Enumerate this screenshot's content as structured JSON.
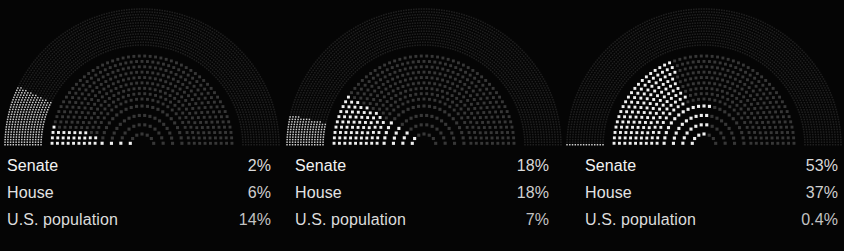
{
  "background": "#050505",
  "colors": {
    "dot_dim": "#3a3a3a",
    "dot_dim_outer": "#262626",
    "dot_highlight": "#efefef",
    "dot_highlight_outer": "#cfcfcf",
    "label_text": "#ededed",
    "value_text": "#d0d0d0"
  },
  "chart_data": {
    "type": "pie",
    "title": "",
    "subtitle": "",
    "xlabel": "",
    "ylabel": "",
    "legend_position": "below",
    "grid": false,
    "chart_style": "concentric-semicircle-dot-arcs",
    "ring_order_outer_to_inner": [
      "U.S. population",
      "House",
      "Senate"
    ],
    "rings": [
      {
        "name": "U.S. population",
        "dot_count": 1000,
        "rows": 14,
        "dot_size_px": 1.5
      },
      {
        "name": "House",
        "dot_count": 435,
        "rows": 9,
        "dot_size_px": 3.0
      },
      {
        "name": "Senate",
        "dot_count": 100,
        "rows": 4,
        "dot_size_px": 3.2
      }
    ],
    "panels": [
      {
        "id": "panel-1",
        "series": [
          {
            "name": "Senate",
            "value": 2,
            "label": "2%"
          },
          {
            "name": "House",
            "value": 6,
            "label": "6%"
          },
          {
            "name": "U.S. population",
            "value": 14,
            "label": "14%"
          }
        ]
      },
      {
        "id": "panel-2",
        "series": [
          {
            "name": "Senate",
            "value": 18,
            "label": "18%"
          },
          {
            "name": "House",
            "value": 18,
            "label": "18%"
          },
          {
            "name": "U.S. population",
            "value": 7,
            "label": "7%"
          }
        ]
      },
      {
        "id": "panel-3",
        "series": [
          {
            "name": "Senate",
            "value": 53,
            "label": "53%"
          },
          {
            "name": "House",
            "value": 37,
            "label": "37%"
          },
          {
            "name": "U.S. population",
            "value": 0.4,
            "label": "0.4%"
          }
        ]
      }
    ]
  },
  "panels": [
    {
      "rows": [
        {
          "label": "Senate",
          "value": "2%"
        },
        {
          "label": "House",
          "value": "6%"
        },
        {
          "label": "U.S. population",
          "value": "14%"
        }
      ]
    },
    {
      "rows": [
        {
          "label": "Senate",
          "value": "18%"
        },
        {
          "label": "House",
          "value": "18%"
        },
        {
          "label": "U.S. population",
          "value": "7%"
        }
      ]
    },
    {
      "rows": [
        {
          "label": "Senate",
          "value": "53%"
        },
        {
          "label": "House",
          "value": "37%"
        },
        {
          "label": "U.S.  population",
          "value": "0.4%"
        }
      ]
    }
  ]
}
